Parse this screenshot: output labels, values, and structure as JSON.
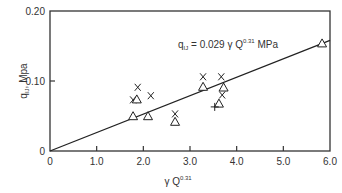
{
  "chart_data": {
    "type": "scatter",
    "title": "",
    "xlabel": "γ Q^0.31",
    "ylabel": "q_IJ, Mpa",
    "xlim": [
      0,
      6.0
    ],
    "ylim": [
      0,
      0.2
    ],
    "x_ticks": [
      "0",
      "1.0",
      "2.0",
      "3.0",
      "4.0",
      "5.0",
      "6.0"
    ],
    "y_ticks": [
      "0",
      "0.10",
      "0.20"
    ],
    "grid": false,
    "legend": null,
    "annotation": {
      "text_main": "q",
      "text_sub": "IJ",
      "text_eq": " = 0.029 γ Q",
      "text_sup": "0.31",
      "text_unit": " MPa"
    },
    "fit_line": {
      "x": [
        0,
        6.0
      ],
      "y": [
        0,
        0.158
      ]
    },
    "series": [
      {
        "name": "cross",
        "marker": "x",
        "points": [
          [
            1.88,
            0.091
          ],
          [
            1.78,
            0.073
          ],
          [
            2.16,
            0.079
          ],
          [
            2.68,
            0.053
          ],
          [
            3.28,
            0.106
          ],
          [
            3.67,
            0.106
          ],
          [
            3.69,
            0.08
          ]
        ]
      },
      {
        "name": "triangle",
        "marker": "triangle",
        "points": [
          [
            1.86,
            0.073
          ],
          [
            1.78,
            0.049
          ],
          [
            2.1,
            0.049
          ],
          [
            2.68,
            0.041
          ],
          [
            3.28,
            0.091
          ],
          [
            3.72,
            0.09
          ],
          [
            3.62,
            0.067
          ],
          [
            5.83,
            0.153
          ]
        ]
      },
      {
        "name": "plus",
        "marker": "+",
        "points": [
          [
            3.53,
            0.063
          ]
        ]
      }
    ]
  },
  "axes": {
    "y_tick_labels": [
      "0",
      "0.10",
      "0.20"
    ],
    "x_tick_labels": [
      "0",
      "1.0",
      "2.0",
      "3.0",
      "4.0",
      "5.0",
      "6.0"
    ],
    "xlabel_main": "γ Q",
    "xlabel_sup": "0.31",
    "ylabel_main": "q",
    "ylabel_sub": "IJ",
    "ylabel_unit": ", Mpa"
  }
}
